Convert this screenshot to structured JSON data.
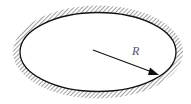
{
  "diagram": {
    "radius_label": "R",
    "colors": {
      "stroke": "#111111",
      "hatch": "#777777",
      "label": "#555555",
      "background": "#ffffff"
    }
  }
}
